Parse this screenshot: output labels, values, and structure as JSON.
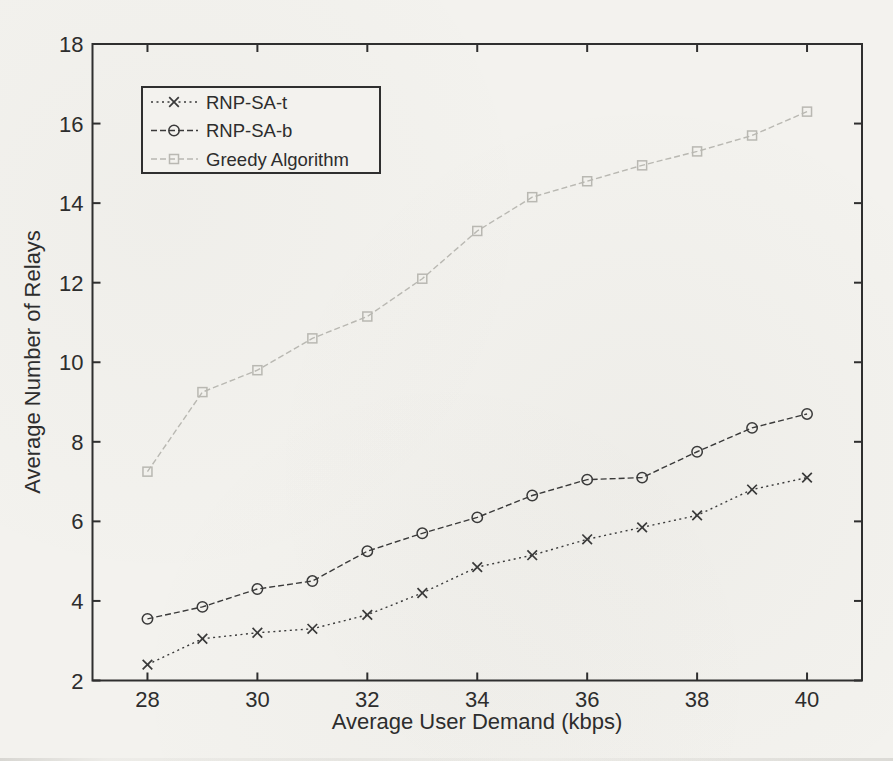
{
  "figure": {
    "paper_color": "#f3f2ee",
    "axis_color": "#2f2f2f",
    "text_color": "#2d2d2d",
    "ink_color": "#3a3a3a",
    "greedy_color": "#b9b8b2"
  },
  "chart_data": {
    "type": "line",
    "title": "",
    "xlabel": "Average User Demand (kbps)",
    "ylabel": "Average Number of Relays",
    "xlim": [
      27,
      41
    ],
    "ylim": [
      2,
      18
    ],
    "xticks": [
      28,
      30,
      32,
      34,
      36,
      38,
      40
    ],
    "yticks": [
      2,
      4,
      6,
      8,
      10,
      12,
      14,
      16,
      18
    ],
    "grid": false,
    "legend_position": "upper-left-inside",
    "x": [
      28,
      29,
      30,
      31,
      32,
      33,
      34,
      35,
      36,
      37,
      38,
      39,
      40
    ],
    "series": [
      {
        "name": "RNP-SA-t",
        "marker": "x",
        "linestyle": "dotted",
        "color": "#3a3a3a",
        "values": [
          2.4,
          3.05,
          3.2,
          3.3,
          3.65,
          4.2,
          4.85,
          5.15,
          5.55,
          5.85,
          6.15,
          6.8,
          7.1
        ]
      },
      {
        "name": "RNP-SA-b",
        "marker": "circle",
        "linestyle": "dashed",
        "color": "#3a3a3a",
        "values": [
          3.55,
          3.85,
          4.3,
          4.5,
          5.25,
          5.7,
          6.1,
          6.65,
          7.05,
          7.1,
          7.75,
          8.35,
          8.7
        ]
      },
      {
        "name": "Greedy Algorithm",
        "marker": "square",
        "linestyle": "dashed",
        "color": "#b9b8b2",
        "values": [
          7.25,
          9.25,
          9.8,
          10.6,
          11.15,
          12.1,
          13.3,
          14.15,
          14.55,
          14.95,
          15.3,
          15.7,
          16.3
        ]
      }
    ]
  }
}
